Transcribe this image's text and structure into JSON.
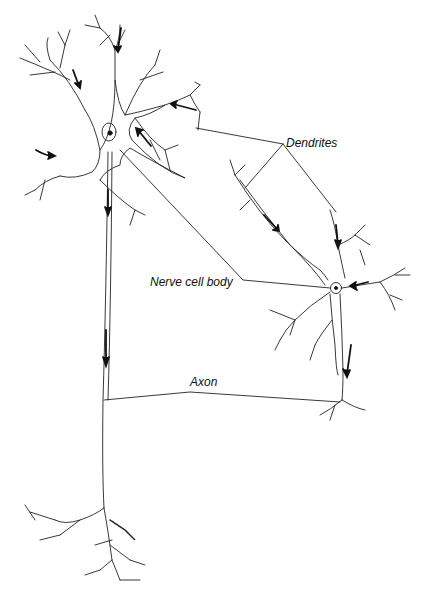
{
  "diagram": {
    "type": "neuron-anatomy",
    "labels": {
      "dendrites": "Dendrites",
      "nerve_cell_body": "Nerve cell body",
      "axon": "Axon"
    },
    "neurons": [
      {
        "name": "large-neuron",
        "position": "left",
        "arrows": 7
      },
      {
        "name": "small-neuron",
        "position": "right",
        "arrows": 4
      }
    ],
    "colors": {
      "line": "#222222",
      "background": "#ffffff"
    }
  }
}
